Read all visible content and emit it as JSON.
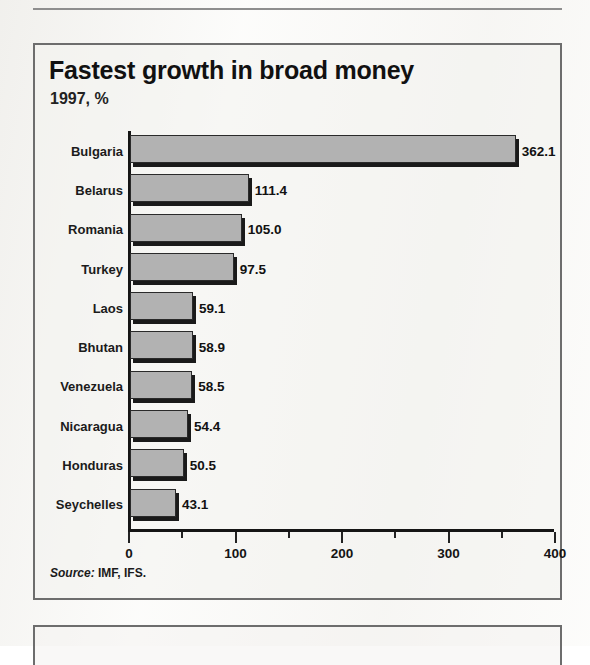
{
  "chart_data": {
    "type": "bar",
    "orientation": "horizontal",
    "title": "Fastest growth in broad money",
    "subtitle": "1997, %",
    "xlabel": "",
    "ylabel": "",
    "xlim": [
      0,
      400
    ],
    "xticks": [
      0,
      100,
      200,
      300,
      400
    ],
    "xtick_labels": [
      "0",
      "100",
      "200",
      "300",
      "400"
    ],
    "minor_xticks": [
      50,
      150,
      250,
      350
    ],
    "grid": false,
    "legend": null,
    "categories": [
      "Bulgaria",
      "Belarus",
      "Romania",
      "Turkey",
      "Laos",
      "Bhutan",
      "Venezuela",
      "Nicaragua",
      "Honduras",
      "Seychelles"
    ],
    "values": [
      362.1,
      111.4,
      105.0,
      97.5,
      59.1,
      58.9,
      58.5,
      54.4,
      50.5,
      43.1
    ],
    "value_labels": [
      "362.1",
      "111.4",
      "105.0",
      "97.5",
      "59.1",
      "58.9",
      "58.5",
      "54.4",
      "50.5",
      "43.1"
    ],
    "source_prefix": "Source:",
    "source_text": "IMF, IFS.",
    "colors": {
      "bar_fill": "#b2b2b2",
      "bar_outline": "#2a2a2a",
      "bar_shadow": "#1a1a1a",
      "axis": "#151515",
      "text": "#111111",
      "box_border": "#6d6d6d",
      "background": "#f3f2ef"
    }
  }
}
